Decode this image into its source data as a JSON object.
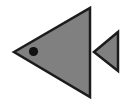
{
  "canvas": {
    "width": 130,
    "height": 106,
    "background_color": "#ffffff",
    "title": "Fish Icon"
  },
  "icon": {
    "name": "fish-icon",
    "description": "Left-pointing fish glyph composed of a large gray body triangle with a dark round eye and a smaller gray tail triangle",
    "fill_color": "#808080",
    "stroke_color": "#1c1c1c",
    "stroke_width": 2.5,
    "eye_color": "#111111"
  },
  "shapes": {
    "body": {
      "label": "fish-body-triangle",
      "points": "14,52 90,8 90,97",
      "fill_color": "#808080",
      "stroke_color": "#1c1c1c"
    },
    "tail": {
      "label": "fish-tail-triangle",
      "points": "94,52 118,32 118,71",
      "fill_color": "#808080",
      "stroke_color": "#1c1c1c"
    },
    "eye": {
      "label": "fish-eye-dot",
      "cx": 33.5,
      "cy": 51.5,
      "r": 4.6,
      "fill_color": "#111111"
    }
  }
}
